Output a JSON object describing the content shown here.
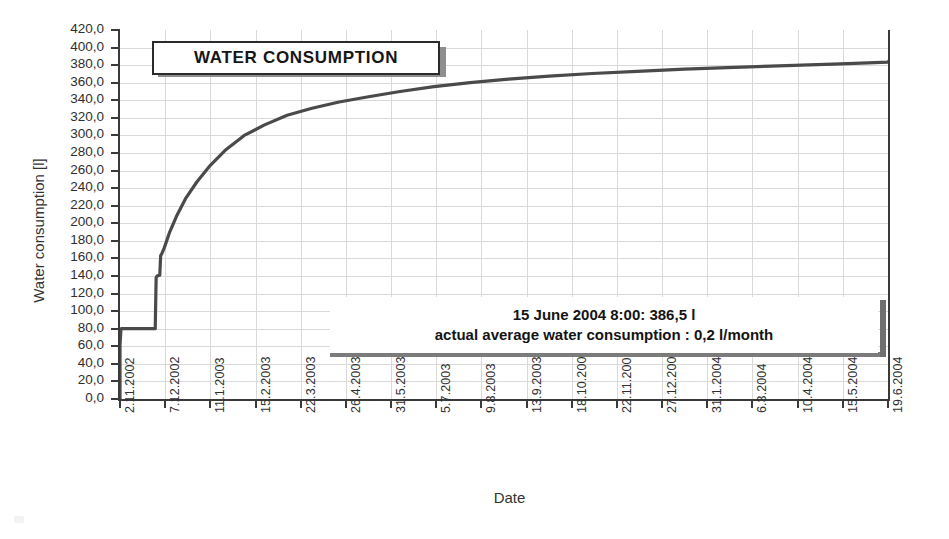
{
  "chart_data": {
    "type": "line",
    "title": "WATER CONSUMPTION",
    "xlabel": "Date",
    "ylabel": "Water consumption [l]",
    "ylim": [
      0,
      420
    ],
    "ytick_step": 20,
    "grid": true,
    "legend": "none",
    "ytick_labels": [
      "420,0",
      "400,0",
      "380,0",
      "360,0",
      "340,0",
      "320,0",
      "300,0",
      "280,0",
      "260,0",
      "240,0",
      "220,0",
      "200,0",
      "180,0",
      "160,0",
      "140,0",
      "120,0",
      "100,0",
      "80,0",
      "60,0",
      "40,0",
      "20,0",
      "0,0"
    ],
    "ytick_values": [
      420,
      400,
      380,
      360,
      340,
      320,
      300,
      280,
      260,
      240,
      220,
      200,
      180,
      160,
      140,
      120,
      100,
      80,
      60,
      40,
      20,
      0
    ],
    "categories": [
      "2.11.2002",
      "7.12.2002",
      "11.1.2003",
      "15.2.2003",
      "22.3.2003",
      "26.4.2003",
      "31.5.2003",
      "5.7.2003",
      "9.8.2003",
      "13.9.2003",
      "18.10.2003",
      "22.11.2003",
      "27.12.2003",
      "31.1.2004",
      "6.3.2004",
      "10.4.2004",
      "15.5.2004",
      "19.6.2004"
    ],
    "series": [
      {
        "name": "Cumulative water consumption",
        "color": "#4a4a4a",
        "points": [
          [
            0.0,
            0.0
          ],
          [
            0.0,
            62.0
          ],
          [
            0.02,
            78.0
          ],
          [
            0.03,
            80.0
          ],
          [
            0.78,
            80.0
          ],
          [
            0.79,
            110.0
          ],
          [
            0.8,
            138.0
          ],
          [
            0.82,
            140.0
          ],
          [
            0.88,
            141.0
          ],
          [
            0.9,
            163.0
          ],
          [
            0.93,
            166.0
          ],
          [
            0.98,
            172.0
          ],
          [
            1.1,
            190.0
          ],
          [
            1.25,
            208.0
          ],
          [
            1.45,
            228.0
          ],
          [
            1.7,
            247.0
          ],
          [
            2.0,
            266.0
          ],
          [
            2.35,
            284.0
          ],
          [
            2.75,
            300.0
          ],
          [
            3.2,
            312.0
          ],
          [
            3.7,
            323.0
          ],
          [
            4.25,
            331.0
          ],
          [
            4.85,
            338.0
          ],
          [
            5.5,
            344.0
          ],
          [
            6.2,
            350.0
          ],
          [
            6.95,
            355.5
          ],
          [
            7.75,
            360.0
          ],
          [
            8.6,
            364.0
          ],
          [
            9.5,
            367.5
          ],
          [
            10.45,
            370.5
          ],
          [
            11.45,
            373.0
          ],
          [
            12.5,
            375.5
          ],
          [
            13.6,
            377.5
          ],
          [
            14.75,
            379.5
          ],
          [
            15.95,
            381.5
          ],
          [
            17.0,
            383.5
          ],
          [
            17.05,
            386.5
          ]
        ]
      }
    ],
    "annotations": [
      {
        "name": "reading-callout",
        "line1": "15 June 2004  8:00: 386,5 l",
        "line2": "actual average water consumption : 0,2 l/month"
      }
    ],
    "final_value": 386.5,
    "final_value_label": "386,5 l",
    "average_rate_label": "0,2 l/month",
    "reading_datetime": "15 June 2004  8:00"
  },
  "colors": {
    "curve": "#4a4a4a",
    "axis": "#3a3a3a",
    "grid": "#d9d9d9",
    "text": "#2a2a2a",
    "plaque_border": "#2b2b2b",
    "plaque_shadow": "#8e8e8e",
    "background": "#ffffff"
  }
}
